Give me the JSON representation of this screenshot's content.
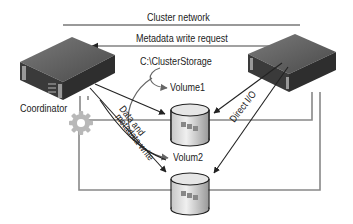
{
  "diagram": {
    "labels": {
      "cluster_network": "Cluster network",
      "metadata_write_request": "Metadata write request",
      "cluster_storage_path": "C:\\ClusterStorage",
      "volume1": "Volume1",
      "volume2": "Volum2",
      "coordinator": "Coordinator",
      "data_metadata_line1": "Data and",
      "data_metadata_line2": "metadata write",
      "direct_io": "Direct I/O"
    },
    "nodes": [
      {
        "id": "coordinator-server",
        "type": "server",
        "label": "Coordinator"
      },
      {
        "id": "node2-server",
        "type": "server",
        "label": ""
      },
      {
        "id": "volume1",
        "type": "disk",
        "label": "Volume1"
      },
      {
        "id": "volume2",
        "type": "disk",
        "label": "Volum2"
      },
      {
        "id": "gear",
        "type": "gear-icon",
        "label": ""
      }
    ],
    "edges": [
      {
        "from": "node2-server",
        "to": "coordinator-server",
        "label": "Metadata write request"
      },
      {
        "from": "coordinator-server",
        "to": "volume1",
        "label": "Data and metadata write"
      },
      {
        "from": "coordinator-server",
        "to": "volume2",
        "label": "Data and metadata write"
      },
      {
        "from": "node2-server",
        "to": "volume1",
        "label": "Direct I/O"
      },
      {
        "from": "node2-server",
        "to": "volume2",
        "label": "Direct I/O"
      }
    ],
    "colors": {
      "line": "#777777",
      "arrow": "#222222",
      "server_top": "#6a6a6a",
      "server_front": "#3e3e3e",
      "disk": "#d8d8d8",
      "gear": "#b8b8b8"
    }
  }
}
